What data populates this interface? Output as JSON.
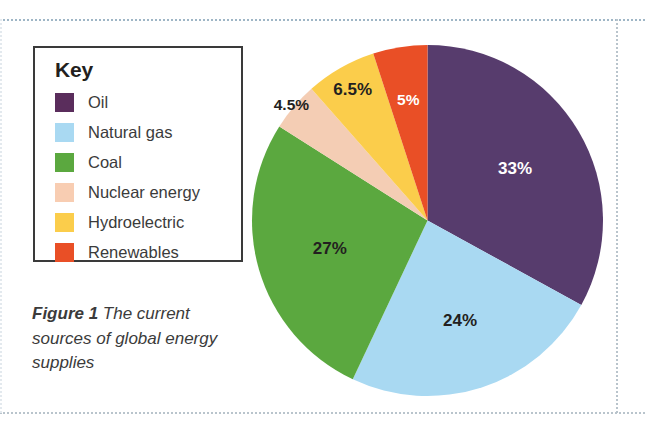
{
  "figure": {
    "caption_prefix": "Figure 1",
    "caption_text": " The current sources of global energy supplies"
  },
  "legend": {
    "title": "Key",
    "items": [
      {
        "label": "Oil",
        "color": "#5a2d5c"
      },
      {
        "label": "Natural gas",
        "color": "#a9d9f2"
      },
      {
        "label": "Coal",
        "color": "#5ba83f"
      },
      {
        "label": "Nuclear energy",
        "color": "#f8cdb2"
      },
      {
        "label": "Hydroelectric",
        "color": "#fbcd4b"
      },
      {
        "label": "Renewables",
        "color": "#e94f26"
      }
    ]
  },
  "chart_data": {
    "type": "pie",
    "title": "The current sources of global energy supplies",
    "legend_position": "left",
    "start_angle_deg": 0,
    "direction": "clockwise",
    "categories": [
      "Oil",
      "Natural gas",
      "Coal",
      "Nuclear energy",
      "Hydroelectric",
      "Renewables"
    ],
    "values": [
      33,
      24,
      27,
      4.5,
      6.5,
      5
    ],
    "unit": "%",
    "labels": [
      "33%",
      "24%",
      "27%",
      "4.5%",
      "6.5%",
      "5%"
    ],
    "colors": [
      "#573c6d",
      "#a9d9f2",
      "#5ba83f",
      "#f4cdb4",
      "#fbcd4b",
      "#e94f26"
    ],
    "label_colors": [
      "#ffffff",
      "#231f20",
      "#231f20",
      "#231f20",
      "#231f20",
      "#ffffff"
    ],
    "label_radius_frac": [
      0.58,
      0.6,
      0.58,
      1.02,
      0.86,
      0.7
    ]
  }
}
